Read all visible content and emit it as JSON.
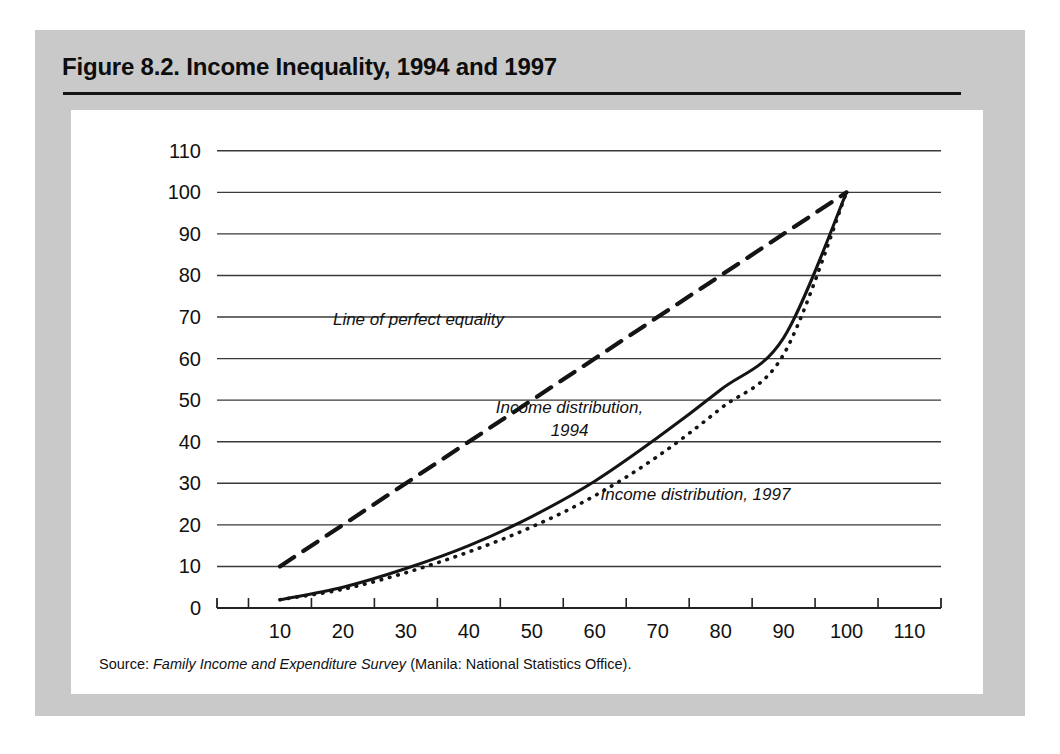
{
  "figure": {
    "title": "Figure 8.2.  Income Inequality, 1994 and 1997",
    "source_label": "Source:",
    "source_italic": "Family Income and Expenditure Survey",
    "source_tail": "(Manila: National Statistics Office).",
    "panel_color": "#c9c9c9",
    "card_color": "#ffffff",
    "ink_color": "#111111"
  },
  "chart_data": {
    "type": "line",
    "title": "Income Inequality, 1994 and 1997",
    "xlabel": "",
    "ylabel": "",
    "xlim": [
      0,
      115
    ],
    "ylim": [
      0,
      115
    ],
    "grid": true,
    "grid_axis": "y",
    "legend": "none",
    "xticks": [
      10,
      20,
      30,
      40,
      50,
      60,
      70,
      80,
      90,
      100,
      110
    ],
    "yticks": [
      0,
      10,
      20,
      30,
      40,
      50,
      60,
      70,
      80,
      90,
      100,
      110
    ],
    "xtick_labels": [
      "10",
      "20",
      "30",
      "40",
      "50",
      "60",
      "70",
      "80",
      "90",
      "100",
      "110"
    ],
    "ytick_labels": [
      "0",
      "10",
      "20",
      "30",
      "40",
      "50",
      "60",
      "70",
      "80",
      "90",
      "100",
      "110"
    ],
    "minor_xticks": [
      5,
      15,
      25,
      35,
      45,
      55,
      65,
      75,
      85,
      95,
      105,
      115
    ],
    "series": [
      {
        "name": "Line of perfect equality",
        "style": "dashed",
        "x": [
          10,
          100
        ],
        "y": [
          10,
          100
        ]
      },
      {
        "name": "Income distribution, 1994",
        "style": "solid",
        "x": [
          10,
          20,
          30,
          40,
          50,
          60,
          70,
          80,
          90,
          100
        ],
        "y": [
          2,
          5,
          9.5,
          15,
          22,
          30.5,
          41,
          52.5,
          65,
          100
        ]
      },
      {
        "name": "Income distribution, 1997",
        "style": "dotted",
        "x": [
          10,
          20,
          30,
          40,
          50,
          60,
          70,
          80,
          90,
          100
        ],
        "y": [
          2,
          4.5,
          8.5,
          13.5,
          19.5,
          27,
          36.5,
          48,
          61,
          100
        ]
      }
    ],
    "annotations": [
      {
        "id": "equality-label",
        "text": "Line of perfect equality",
        "lines": [
          "Line of perfect equality"
        ],
        "x": 32,
        "y": 68
      },
      {
        "id": "dist-1994-label",
        "text": "Income distribution, 1994",
        "lines": [
          "Income distribution,",
          "1994"
        ],
        "x": 56,
        "y": 47
      },
      {
        "id": "dist-1997-label",
        "text": "Income distribution, 1997",
        "lines": [
          "Income distribution, 1997"
        ],
        "x": 76,
        "y": 26
      }
    ]
  }
}
